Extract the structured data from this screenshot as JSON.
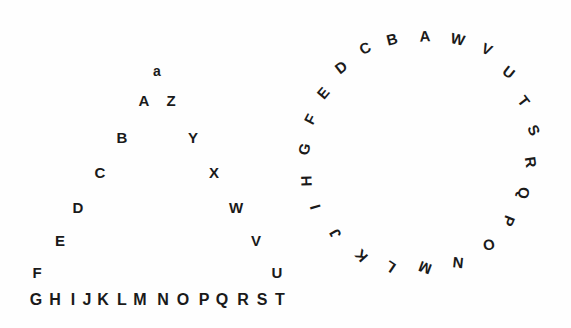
{
  "canvas": {
    "width": 571,
    "height": 328,
    "background_color": "#fefefe",
    "text_color": "#1a1a1a"
  },
  "figures": [
    {
      "name": "triangle-letter-arrangement",
      "description": "Tent / triangle shaped arrangement of letters",
      "groups": [
        {
          "name": "apex",
          "letters": [
            {
              "char": "a",
              "x": 157,
              "y": 71,
              "size": 14,
              "rotation": 0
            }
          ]
        },
        {
          "name": "left-descending-limb",
          "letters": [
            {
              "char": "A",
              "x": 144,
              "y": 100,
              "size": 15,
              "rotation": 0
            },
            {
              "char": "B",
              "x": 122,
              "y": 137,
              "size": 15,
              "rotation": 0
            },
            {
              "char": "C",
              "x": 100,
              "y": 172,
              "size": 15,
              "rotation": 0
            },
            {
              "char": "D",
              "x": 78,
              "y": 207,
              "size": 15,
              "rotation": 0
            },
            {
              "char": "E",
              "x": 60,
              "y": 240,
              "size": 15,
              "rotation": 0
            },
            {
              "char": "F",
              "x": 37,
              "y": 272,
              "size": 15,
              "rotation": 0
            }
          ]
        },
        {
          "name": "right-descending-limb",
          "letters": [
            {
              "char": "Z",
              "x": 171,
              "y": 100,
              "size": 15,
              "rotation": 0
            },
            {
              "char": "Y",
              "x": 193,
              "y": 137,
              "size": 15,
              "rotation": 0
            },
            {
              "char": "X",
              "x": 214,
              "y": 172,
              "size": 15,
              "rotation": 0
            },
            {
              "char": "W",
              "x": 236,
              "y": 207,
              "size": 15,
              "rotation": 0
            },
            {
              "char": "V",
              "x": 256,
              "y": 240,
              "size": 15,
              "rotation": 0
            },
            {
              "char": "U",
              "x": 277,
              "y": 272,
              "size": 15,
              "rotation": 0
            }
          ]
        },
        {
          "name": "baseline-row",
          "letters": [
            {
              "char": "G",
              "x": 36,
              "y": 300,
              "size": 16,
              "rotation": 0
            },
            {
              "char": "H",
              "x": 55,
              "y": 300,
              "size": 16,
              "rotation": 0
            },
            {
              "char": "I",
              "x": 73,
              "y": 300,
              "size": 16,
              "rotation": 0
            },
            {
              "char": "J",
              "x": 87,
              "y": 300,
              "size": 16,
              "rotation": 0
            },
            {
              "char": "K",
              "x": 103,
              "y": 300,
              "size": 16,
              "rotation": 0
            },
            {
              "char": "L",
              "x": 122,
              "y": 300,
              "size": 16,
              "rotation": 0
            },
            {
              "char": "M",
              "x": 140,
              "y": 300,
              "size": 16,
              "rotation": 0
            },
            {
              "char": "N",
              "x": 163,
              "y": 300,
              "size": 16,
              "rotation": 0
            },
            {
              "char": "O",
              "x": 183,
              "y": 300,
              "size": 16,
              "rotation": 0
            },
            {
              "char": "P",
              "x": 204,
              "y": 300,
              "size": 16,
              "rotation": 0
            },
            {
              "char": "Q",
              "x": 222,
              "y": 300,
              "size": 16,
              "rotation": 0
            },
            {
              "char": "R",
              "x": 243,
              "y": 300,
              "size": 16,
              "rotation": 0
            },
            {
              "char": "S",
              "x": 262,
              "y": 300,
              "size": 16,
              "rotation": 0
            },
            {
              "char": "T",
              "x": 280,
              "y": 300,
              "size": 16,
              "rotation": 0
            }
          ]
        }
      ]
    },
    {
      "name": "circle-letter-arrangement",
      "description": "Circular arrangement of letters, A at top, counterclockwise B-O on left, clockwise W-P on right",
      "groups": [
        {
          "name": "circle-apex",
          "letters": [
            {
              "char": "A",
              "x": 425,
              "y": 36,
              "size": 15,
              "rotation": -3
            }
          ]
        },
        {
          "name": "circle-counterclockwise-limb",
          "letters": [
            {
              "char": "B",
              "x": 392,
              "y": 39,
              "size": 15,
              "rotation": -14
            },
            {
              "char": "C",
              "x": 365,
              "y": 48,
              "size": 15,
              "rotation": -26
            },
            {
              "char": "D",
              "x": 341,
              "y": 67,
              "size": 15,
              "rotation": -38
            },
            {
              "char": "E",
              "x": 323,
              "y": 93,
              "size": 15,
              "rotation": -50
            },
            {
              "char": "F",
              "x": 310,
              "y": 119,
              "size": 15,
              "rotation": -62
            },
            {
              "char": "G",
              "x": 304,
              "y": 149,
              "size": 15,
              "rotation": -76
            },
            {
              "char": "H",
              "x": 306,
              "y": 181,
              "size": 15,
              "rotation": -92
            },
            {
              "char": "I",
              "x": 315,
              "y": 207,
              "size": 15,
              "rotation": -106
            },
            {
              "char": "J",
              "x": 335,
              "y": 234,
              "size": 15,
              "rotation": -120
            },
            {
              "char": "K",
              "x": 361,
              "y": 256,
              "size": 15,
              "rotation": -132
            },
            {
              "char": "L",
              "x": 390,
              "y": 267,
              "size": 15,
              "rotation": -146
            },
            {
              "char": "M",
              "x": 425,
              "y": 268,
              "size": 15,
              "rotation": -160
            },
            {
              "char": "N",
              "x": 458,
              "y": 263,
              "size": 15,
              "rotation": -174
            },
            {
              "char": "O",
              "x": 489,
              "y": 245,
              "size": 15,
              "rotation": -192
            }
          ]
        },
        {
          "name": "circle-clockwise-limb",
          "letters": [
            {
              "char": "W",
              "x": 458,
              "y": 39,
              "size": 15,
              "rotation": 13
            },
            {
              "char": "V",
              "x": 487,
              "y": 49,
              "size": 15,
              "rotation": 25
            },
            {
              "char": "U",
              "x": 509,
              "y": 72,
              "size": 15,
              "rotation": 38
            },
            {
              "char": "T",
              "x": 524,
              "y": 101,
              "size": 15,
              "rotation": 52
            },
            {
              "char": "S",
              "x": 534,
              "y": 130,
              "size": 15,
              "rotation": 66
            },
            {
              "char": "R",
              "x": 531,
              "y": 162,
              "size": 15,
              "rotation": 82
            },
            {
              "char": "Q",
              "x": 524,
              "y": 193,
              "size": 15,
              "rotation": 97
            },
            {
              "char": "P",
              "x": 509,
              "y": 221,
              "size": 15,
              "rotation": 112
            }
          ]
        }
      ]
    }
  ]
}
